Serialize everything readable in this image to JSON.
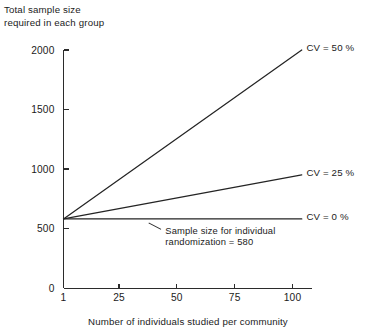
{
  "chart_data": {
    "type": "line",
    "title": "",
    "ylabel_lines": [
      "Total sample size",
      "required in each group"
    ],
    "xlabel": "Number of individuals studied per community",
    "xlim": [
      1,
      112
    ],
    "ylim": [
      0,
      2100
    ],
    "xticks": [
      1,
      25,
      50,
      75,
      100
    ],
    "xticklabels": [
      "1",
      "25",
      "50",
      "75",
      "100"
    ],
    "yticks": [
      0,
      500,
      1000,
      1500,
      2000
    ],
    "yticklabels": [
      "0",
      "500",
      "1000",
      "1500",
      "2000"
    ],
    "grid": false,
    "legend_position": "inline-right-of-line-ends",
    "baseline_value": 580,
    "series": [
      {
        "name": "CV = 50 %",
        "label": "CV = 50 %",
        "x": [
          1,
          104
        ],
        "y": [
          580,
          2000
        ],
        "label_x": 106,
        "label_y": 2025
      },
      {
        "name": "CV = 25 %",
        "label": "CV = 25 %",
        "x": [
          1,
          104
        ],
        "y": [
          580,
          950
        ],
        "label_x": 106,
        "label_y": 975
      },
      {
        "name": "CV = 0 %",
        "label": "CV = 0 %",
        "x": [
          1,
          104
        ],
        "y": [
          580,
          580
        ],
        "label_x": 106,
        "label_y": 605
      }
    ],
    "annotations": [
      {
        "name": "individual-randomization-note",
        "lines": [
          "Sample size for individual",
          "randomization = 580"
        ],
        "text_x": 45,
        "text_y": 455,
        "leader_from_x": 43,
        "leader_from_y": 495,
        "leader_to_x": 38,
        "leader_to_y": 545
      }
    ]
  }
}
